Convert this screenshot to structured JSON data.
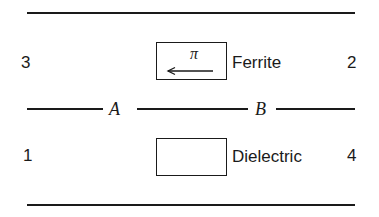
{
  "diagram": {
    "ports": {
      "port_3": "3",
      "port_2": "2",
      "port_1": "1",
      "port_4": "4"
    },
    "junctions": {
      "a": "A",
      "b": "B"
    },
    "ferrite": {
      "label": "Ferrite",
      "symbol": "π",
      "arrow_direction": "left"
    },
    "dielectric": {
      "label": "Dielectric"
    },
    "colors": {
      "ink": "#1a1a1a",
      "background": "#ffffff"
    }
  }
}
